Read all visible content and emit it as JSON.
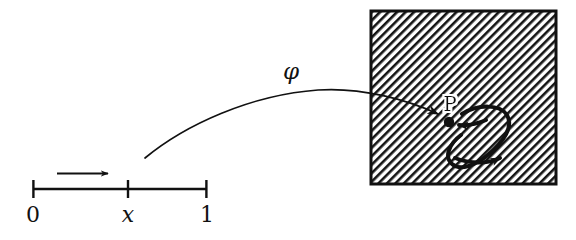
{
  "figure": {
    "background_color": "#ffffff",
    "ink_color": "#111111",
    "width": 576,
    "height": 240
  },
  "interval": {
    "name": "unit-interval",
    "labels": {
      "left_endpoint": "0",
      "interior_point": "x",
      "right_endpoint": "1"
    },
    "direction_arrow": {
      "name": "direction-arrow",
      "meaning": "increasing parameter"
    },
    "geometry": {
      "y": 189,
      "x_start": 33,
      "x_tick": 128,
      "x_end": 207,
      "tick_half_height": 9
    }
  },
  "map": {
    "label": "φ",
    "label_name": "phi",
    "arrow_name": "phi-arrow",
    "from": "x",
    "to": "P"
  },
  "target_region": {
    "name": "hatched-square",
    "fill_pattern": "diagonal-hatch",
    "hatch_angle_deg": 45,
    "hatch_spacing_px": 6,
    "border_color": "#111111",
    "geometry": {
      "x": 371,
      "y": 11,
      "width": 185,
      "height": 173
    }
  },
  "base_point": {
    "label": "P",
    "name": "point-p",
    "geometry": {
      "cx": 449,
      "cy": 122,
      "r": 5
    }
  },
  "loop": {
    "name": "loop-at-p",
    "description": "closed oriented loop based at P",
    "arrowheads": 2,
    "orientation": "counterclockwise"
  }
}
